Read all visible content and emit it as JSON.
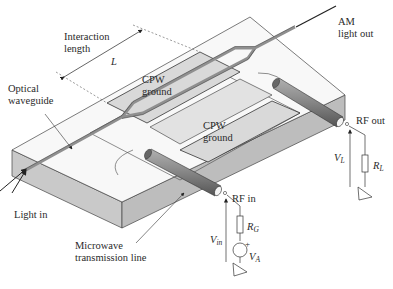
{
  "figure": {
    "type": "schematic",
    "colors": {
      "background": "#ffffff",
      "slab_top": "#f7f7f7",
      "slab_front": "#c9c9c9",
      "slab_right": "#bdbdbd",
      "electrode": "#d9d9d9",
      "waveguide": "#9a9a9a",
      "coax": "#7d7d7d",
      "line": "#333333"
    }
  },
  "labels": {
    "interaction_length": [
      "Interaction",
      "length"
    ],
    "length_symbol": "L",
    "optical_waveguide": [
      "Optical",
      "waveguide"
    ],
    "cpw_ground_top": [
      "CPW",
      "ground"
    ],
    "cpw_ground_bottom": [
      "CPW",
      "ground"
    ],
    "am_light_out": [
      "AM",
      "light out"
    ],
    "rf_out": "RF out",
    "rf_in": "RF in",
    "light_in": "Light in",
    "microwave_line": [
      "Microwave",
      "transmission line"
    ],
    "v_l": {
      "main": "V",
      "sub": "L"
    },
    "r_l": {
      "main": "R",
      "sub": "L"
    },
    "v_in": {
      "main": "V",
      "sub": "in"
    },
    "r_g": {
      "main": "R",
      "sub": "G"
    },
    "v_a": {
      "main": "V",
      "sub": "A"
    },
    "plus": "+"
  }
}
